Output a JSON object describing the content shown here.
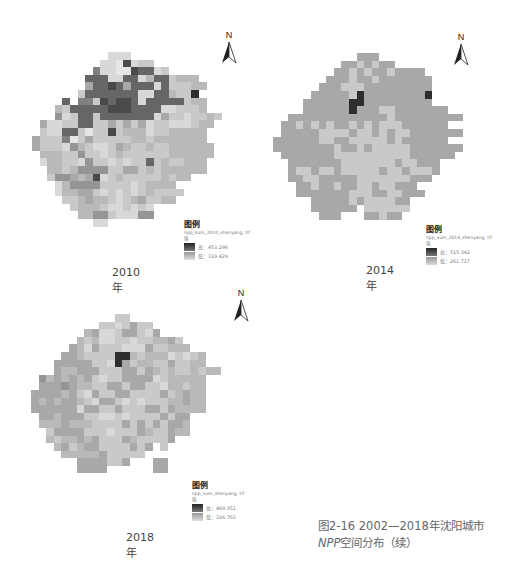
{
  "figure": {
    "caption_line1": "图2-16 2002—2018年沈阳城市",
    "caption_line2_npp": "NPP",
    "caption_line2_rest": "空间分布（续）"
  },
  "palette": {
    "0": "#2e2e2e",
    "1": "#4a4a4a",
    "2": "#666666",
    "3": "#808080",
    "4": "#959595",
    "5": "#a8a8a8",
    "6": "#b9b9b9",
    "7": "#c9c9c9",
    "8": "#d8d8d8",
    "9": "#e6e6e6"
  },
  "maps": [
    {
      "year_label": "2010年",
      "north_label": "N",
      "legend": {
        "title": "图例",
        "file": "npp_sum_2010_shenyang. tif",
        "value_label": "值",
        "high": "高：453.296",
        "low": "低：319.429"
      },
      "grid": [
        "..........888.............",
        ".........8891877..........",
        "........3889912287........",
        ".......222882286227666....",
        ".......5221252228277766...",
        "......7222222288226770....",
        "....2.33712112822222766...",
        "...67222221112222887776...",
        "...4872272222222857787767.",
        ".58877227757575877888766..",
        ".7882279771766687766666...",
        "57773975777776676666666...",
        "577784678875677677666666..",
        ".66677477876777777666666..",
        ".8667784778787727677666...",
        "..667644447755767666666...",
        "..7445651876777776766.....",
        "...8644447777876666.......",
        "...86655787878767777......",
        "....776566787657766.......",
        ".....76667887878..........",
        "......6644788844..........",
        "........88................"
      ],
      "chart_data": {
        "type": "heatmap",
        "title": "2010年 NPP空间分布",
        "legend_high": 453.296,
        "legend_low": 319.429,
        "colormap": "grayscale (dark = high, light = low)"
      }
    },
    {
      "year_label": "2014年",
      "north_label": "N",
      "legend": {
        "title": "图例",
        "file": "npp_sum_2014_shenyang. tif",
        "value_label": "值",
        "high": "高：515.342",
        "low": "低：261.717"
      },
      "grid": [
        "...........555............",
        ".........5575755..........",
        "........557575575555......",
        ".......55575575555555.....",
        "......555777555555555.....",
        ".....5555570555555550.....",
        "....55555500555555555.....",
        "....5555550555775555555...",
        "..55555555555557555555555.",
        ".5575757557575777555555...",
        ".555557777577575775555555.",
        "55555577557777757555555...",
        "5555555575575777775555555.",
        ".55555557777777777555555..",
        "..55555557777777577555....",
        "..57757757777757757775....",
        "..5577555557777777555.....",
        "...5575575577577555.......",
        "...55555557775577555......",
        ".....5555575777755........",
        ".....555555.777777........",
        "......555...55755........."
      ],
      "chart_data": {
        "type": "heatmap",
        "title": "2014年 NPP空间分布",
        "legend_high": 515.342,
        "legend_low": 261.717,
        "colormap": "grayscale (dark = high, light = low)"
      }
    },
    {
      "year_label": "2018年",
      "north_label": "N",
      "legend": {
        "title": "图例",
        "file": "npp_sum_shenyang. tif",
        "value_label": "值",
        "high": "高：469.351",
        "low": "低：326.763"
      },
      "grid": [
        "...........77.............",
        ".........7787577..........",
        ".......6588755785.........",
        "......67688778776657......",
        ".....5685777888577666.....",
        "....5567777006766687876...",
        "...55555778057667757766...",
        "...5665557775575676776766.",
        ".4656565787755558766666...",
        ".5554566775575577866766...",
        "55556578577557777576566...",
        "56565567855787877766566...",
        "55555585577577755756666...",
        ".55655577887877775755.....",
        ".66656667777575757556.....",
        "..7555577787775677566.....",
        "..67665657775677775.......",
        "...6576557777575.7........",
        "....66666577777...........",
        "......5555775...55........",
        "......5555......55........"
      ],
      "chart_data": {
        "type": "heatmap",
        "title": "2018年 NPP空间分布",
        "legend_high": 469.351,
        "legend_low": 326.763,
        "colormap": "grayscale (dark = high, light = low)"
      }
    }
  ],
  "chart_data": [
    {
      "type": "heatmap",
      "title": "2010年",
      "legend": {
        "high": 453.296,
        "low": 319.429
      },
      "raster": "npp_sum_2010_shenyang.tif"
    },
    {
      "type": "heatmap",
      "title": "2014年",
      "legend": {
        "high": 515.342,
        "low": 261.717
      },
      "raster": "npp_sum_2014_shenyang.tif"
    },
    {
      "type": "heatmap",
      "title": "2018年",
      "legend": {
        "high": 469.351,
        "low": 326.763
      },
      "raster": "npp_sum_shenyang.tif"
    }
  ]
}
